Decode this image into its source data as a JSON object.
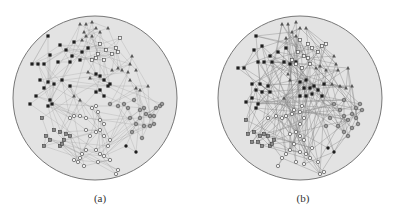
{
  "figure": {
    "panels": [
      {
        "id": "a",
        "caption": "(a)",
        "circle": {
          "cx": 95,
          "cy": 98,
          "r": 82,
          "fill": "#e3e3e3",
          "stroke": "#777777"
        },
        "edge_style": {
          "color": "#9a9a9a",
          "opacity": 0.55,
          "width": 0.5
        },
        "nodes": {
          "filled_square": [
            [
              48,
              36
            ],
            [
              60,
              45
            ],
            [
              50,
              55
            ],
            [
              66,
              50
            ],
            [
              74,
              42
            ],
            [
              72,
              56
            ],
            [
              82,
              52
            ],
            [
              58,
              62
            ],
            [
              44,
              64
            ],
            [
              38,
              64
            ],
            [
              32,
              64
            ],
            [
              70,
              62
            ],
            [
              80,
              60
            ],
            [
              88,
              48
            ],
            [
              40,
              80
            ],
            [
              48,
              82
            ],
            [
              54,
              84
            ],
            [
              62,
              80
            ],
            [
              70,
              86
            ],
            [
              44,
              88
            ],
            [
              36,
              96
            ],
            [
              30,
              104
            ],
            [
              50,
              100
            ],
            [
              52,
              104
            ],
            [
              48,
              106
            ],
            [
              96,
              74
            ],
            [
              100,
              76
            ],
            [
              104,
              80
            ],
            [
              96,
              92
            ],
            [
              100,
              90
            ],
            [
              108,
              86
            ],
            [
              110,
              84
            ],
            [
              104,
              96
            ]
          ],
          "open_square": [
            [
              120,
              38
            ],
            [
              100,
              44
            ],
            [
              106,
              50
            ],
            [
              98,
              54
            ],
            [
              96,
              58
            ],
            [
              116,
              48
            ],
            [
              112,
              54
            ],
            [
              118,
              52
            ],
            [
              92,
              60
            ],
            [
              104,
              60
            ]
          ],
          "triangle": [
            [
              80,
              24
            ],
            [
              86,
              24
            ],
            [
              92,
              22
            ],
            [
              96,
              28
            ],
            [
              84,
              32
            ],
            [
              86,
              36
            ],
            [
              92,
              36
            ],
            [
              100,
              32
            ],
            [
              108,
              28
            ],
            [
              82,
              40
            ],
            [
              132,
              56
            ],
            [
              130,
              64
            ],
            [
              112,
              70
            ],
            [
              118,
              68
            ],
            [
              122,
              70
            ],
            [
              128,
              72
            ],
            [
              136,
              70
            ],
            [
              88,
              72
            ],
            [
              90,
              78
            ],
            [
              130,
              80
            ],
            [
              136,
              88
            ],
            [
              140,
              90
            ],
            [
              148,
              86
            ],
            [
              74,
              96
            ],
            [
              80,
              100
            ]
          ],
          "gray_square": [
            [
              42,
              118
            ],
            [
              54,
              130
            ],
            [
              60,
              132
            ],
            [
              66,
              134
            ],
            [
              70,
              136
            ],
            [
              46,
              136
            ],
            [
              50,
              140
            ],
            [
              64,
              140
            ],
            [
              44,
              146
            ],
            [
              60,
              146
            ],
            [
              62,
              144
            ]
          ],
          "open_circle": [
            [
              70,
              118
            ],
            [
              74,
              116
            ],
            [
              80,
              116
            ],
            [
              86,
              118
            ],
            [
              92,
              108
            ],
            [
              96,
              106
            ],
            [
              98,
              112
            ],
            [
              100,
              120
            ],
            [
              104,
              124
            ],
            [
              96,
              132
            ],
            [
              90,
              136
            ],
            [
              86,
              130
            ],
            [
              100,
              130
            ],
            [
              104,
              136
            ],
            [
              110,
              140
            ],
            [
              108,
              146
            ],
            [
              86,
              150
            ],
            [
              82,
              154
            ],
            [
              80,
              158
            ],
            [
              78,
              162
            ],
            [
              74,
              160
            ],
            [
              96,
              150
            ],
            [
              100,
              154
            ],
            [
              104,
              156
            ],
            [
              98,
              162
            ],
            [
              84,
              166
            ],
            [
              110,
              160
            ],
            [
              118,
              170
            ],
            [
              116,
              174
            ]
          ],
          "gray_circle": [
            [
              110,
              104
            ],
            [
              118,
              106
            ],
            [
              124,
              104
            ],
            [
              128,
              108
            ],
            [
              134,
              100
            ],
            [
              140,
              110
            ],
            [
              144,
              108
            ],
            [
              146,
              114
            ],
            [
              150,
              116
            ],
            [
              154,
              116
            ],
            [
              130,
              118
            ],
            [
              140,
              118
            ],
            [
              136,
              124
            ],
            [
              144,
              126
            ],
            [
              150,
              126
            ],
            [
              132,
              132
            ],
            [
              142,
              138
            ],
            [
              156,
              108
            ],
            [
              160,
              106
            ],
            [
              154,
              124
            ],
            [
              162,
              104
            ]
          ],
          "filled_circle": [
            [
              126,
              146
            ],
            [
              136,
              152
            ]
          ]
        }
      },
      {
        "id": "b",
        "caption": "(b)",
        "circle": {
          "cx": 300,
          "cy": 98,
          "r": 82,
          "fill": "#e3e3e3",
          "stroke": "#777777"
        },
        "edge_style": {
          "color": "#8a8a8a",
          "opacity": 0.7,
          "width": 0.6
        },
        "nodes": {
          "filled_square": [
            [
              256,
              36
            ],
            [
              254,
              50
            ],
            [
              262,
              46
            ],
            [
              270,
              56
            ],
            [
              278,
              52
            ],
            [
              286,
              48
            ],
            [
              258,
              62
            ],
            [
              264,
              62
            ],
            [
              272,
              62
            ],
            [
              284,
              62
            ],
            [
              290,
              64
            ],
            [
              296,
              62
            ],
            [
              244,
              68
            ],
            [
              238,
              68
            ],
            [
              252,
              84
            ],
            [
              260,
              84
            ],
            [
              268,
              86
            ],
            [
              256,
              90
            ],
            [
              262,
              92
            ],
            [
              270,
              92
            ],
            [
              252,
              98
            ],
            [
              246,
              102
            ],
            [
              258,
              104
            ],
            [
              256,
              108
            ],
            [
              300,
              82
            ],
            [
              306,
              80
            ],
            [
              304,
              88
            ],
            [
              310,
              88
            ],
            [
              314,
              86
            ],
            [
              318,
              90
            ],
            [
              300,
              96
            ],
            [
              306,
              96
            ],
            [
              312,
              94
            ],
            [
              324,
              84
            ],
            [
              322,
              96
            ]
          ],
          "open_square": [
            [
              300,
              40
            ],
            [
              308,
              44
            ],
            [
              312,
              48
            ],
            [
              318,
              52
            ],
            [
              322,
              46
            ],
            [
              326,
              44
            ],
            [
              298,
              52
            ],
            [
              304,
              56
            ],
            [
              308,
              58
            ],
            [
              292,
              60
            ],
            [
              296,
              64
            ],
            [
              310,
              64
            ],
            [
              302,
              68
            ]
          ],
          "triangle": [
            [
              282,
              24
            ],
            [
              288,
              24
            ],
            [
              296,
              22
            ],
            [
              300,
              28
            ],
            [
              292,
              32
            ],
            [
              296,
              36
            ],
            [
              286,
              38
            ],
            [
              306,
              28
            ],
            [
              334,
              56
            ],
            [
              336,
              64
            ],
            [
              316,
              68
            ],
            [
              320,
              66
            ],
            [
              326,
              70
            ],
            [
              338,
              70
            ],
            [
              348,
              68
            ],
            [
              288,
              74
            ],
            [
              290,
              80
            ],
            [
              332,
              84
            ],
            [
              340,
              86
            ],
            [
              346,
              88
            ],
            [
              352,
              86
            ],
            [
              284,
              98
            ]
          ],
          "gray_square": [
            [
              246,
              120
            ],
            [
              248,
              134
            ],
            [
              254,
              132
            ],
            [
              260,
              136
            ],
            [
              264,
              134
            ],
            [
              268,
              136
            ],
            [
              252,
              142
            ],
            [
              258,
              142
            ],
            [
              262,
              146
            ],
            [
              270,
              146
            ],
            [
              274,
              140
            ],
            [
              272,
              144
            ]
          ],
          "open_circle": [
            [
              268,
              118
            ],
            [
              276,
              116
            ],
            [
              282,
              118
            ],
            [
              286,
              116
            ],
            [
              292,
              114
            ],
            [
              294,
              110
            ],
            [
              300,
              112
            ],
            [
              302,
              106
            ],
            [
              304,
              118
            ],
            [
              300,
              124
            ],
            [
              296,
              132
            ],
            [
              290,
              134
            ],
            [
              300,
              136
            ],
            [
              304,
              140
            ],
            [
              294,
              144
            ],
            [
              290,
              150
            ],
            [
              286,
              154
            ],
            [
              282,
              158
            ],
            [
              300,
              152
            ],
            [
              306,
              154
            ],
            [
              310,
              158
            ],
            [
              304,
              164
            ],
            [
              296,
              162
            ],
            [
              278,
              166
            ],
            [
              312,
              148
            ],
            [
              318,
              162
            ],
            [
              320,
              174
            ],
            [
              324,
              172
            ]
          ],
          "gray_circle": [
            [
              334,
              104
            ],
            [
              340,
              110
            ],
            [
              344,
              116
            ],
            [
              348,
              120
            ],
            [
              352,
              114
            ],
            [
              356,
              118
            ],
            [
              358,
              124
            ],
            [
              352,
              128
            ],
            [
              344,
              132
            ],
            [
              338,
              126
            ],
            [
              348,
              136
            ],
            [
              356,
              108
            ],
            [
              360,
              104
            ],
            [
              362,
              110
            ],
            [
              330,
              118
            ],
            [
              326,
              126
            ],
            [
              344,
              100
            ]
          ],
          "filled_circle": [
            [
              328,
              148
            ],
            [
              334,
              152
            ]
          ]
        }
      }
    ]
  }
}
